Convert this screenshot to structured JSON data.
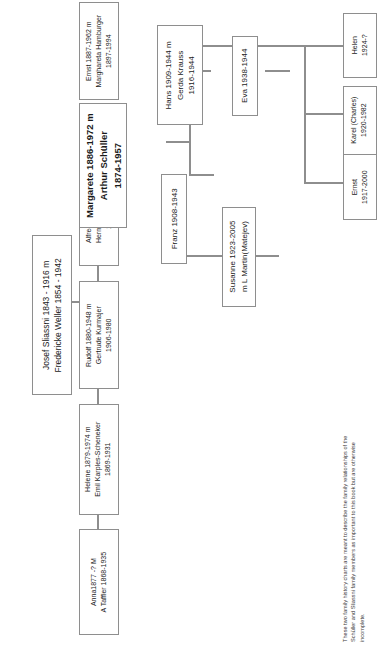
{
  "document": {
    "type": "family-history-chart",
    "orientation": "rotated-90-ccw",
    "footnote": "These two family history charts are meant to describe the family relationships of the  Schüller and Sliassni family members as important to this book but are otherwise incomplete."
  },
  "colors": {
    "box_border": "#8e8e8e",
    "connector": "#8e8e8e",
    "text": "#1a1a1a",
    "background": "#ffffff"
  },
  "nodes": {
    "root": {
      "line1": "Josef Sliassni 1843 - 1916 m",
      "line2": "Fredericke Weller 1854 - 1942"
    },
    "anna": {
      "line1": "Anna1877 -? M",
      "line2": "A Taffler 1868-1935"
    },
    "helene": {
      "line1": "Helene 1879-1974 m",
      "line2": "Emil Karples-Scheneker",
      "line3": "1869-1931"
    },
    "rudolf": {
      "line1": "Rudolf 1880-1948 m",
      "line2": "Gertrude Kurmajer",
      "line3": "1906-1980"
    },
    "alfred": {
      "line1": "Alfred 1883-1961 m",
      "line2": "Hermine Weinmann",
      "line3": "1869-1962"
    },
    "margarete": {
      "line1": "Margarete 1886-1972 m",
      "line2": "Arthur Schüller",
      "line3": "1874-1957"
    },
    "ernst_sr": {
      "line1": "Ernst 1887-1962 m",
      "line2": "Marghareta Hamburger",
      "line3": "1897-1994"
    },
    "hans": {
      "line1": "Hans 1909-1944 m",
      "line2": "Gerda Krauss",
      "line3": "1916-1944"
    },
    "franz": {
      "line1": "Franz 1908-1943"
    },
    "susanne": {
      "line1": "Susanne 1923-2005",
      "line2": "m L Martin(Matejev)"
    },
    "eva": {
      "line1": "Eva 1938-1944"
    },
    "helen": {
      "line1": "Helen",
      "line2": "1924-?"
    },
    "karel": {
      "line1": "Karel (Charles)",
      "line2": "1920-1982"
    },
    "ernst_jr": {
      "line1": "Ernst",
      "line2": "1917-2000"
    }
  }
}
